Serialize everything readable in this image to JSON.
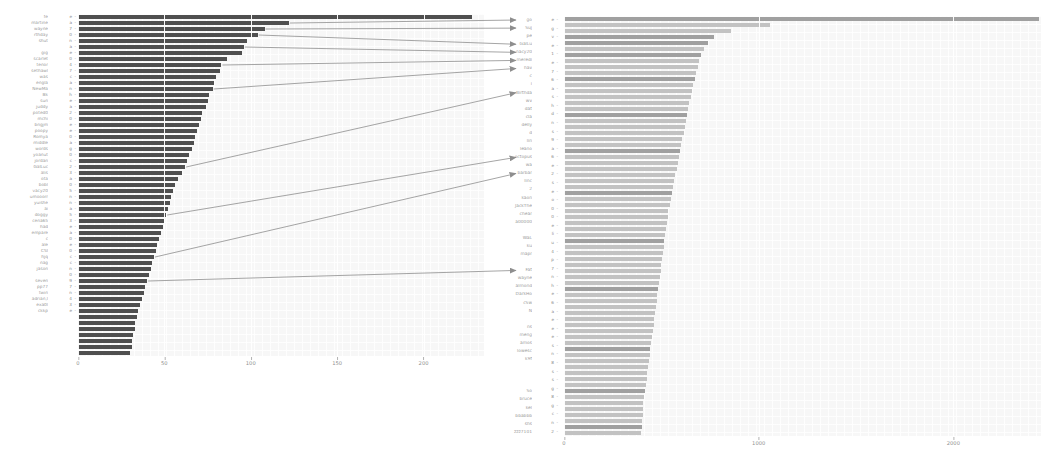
{
  "figure": {
    "background": "#ffffff",
    "panel_background": "#f7f7f7",
    "left_bar_color": "#4f4f4f",
    "right_bar_color": "#c2c2c2",
    "right_bar_highlight_color": "#a0a0a0",
    "arrow_color": "#8e8e8e",
    "tick_text_color": "#8f8f8f",
    "label_text_color": "#9b9b9b"
  },
  "chart_data": [
    {
      "id": "left",
      "type": "bar",
      "orientation": "horizontal",
      "title": "",
      "xlabel": "",
      "ylabel": "",
      "xlim": [
        0,
        235
      ],
      "xticks": [
        0,
        50,
        100,
        150,
        200
      ],
      "grid": true,
      "sorted": "descending",
      "bar_color": "#4f4f4f",
      "categories": [
        "fe",
        "martine",
        "wayne",
        "rthday",
        "shut",
        "",
        "gig",
        "scarlet",
        "tenor",
        "sethawl",
        "was",
        "engla",
        "NewMa",
        "Bk",
        "sun",
        "juddy",
        "poted0",
        "mchi",
        "bngjm",
        "poopy",
        "Romya",
        "middle",
        "words",
        "yoanut",
        "jordan",
        "GalLuc",
        "alis",
        "ota",
        "bobl",
        "vacy20",
        "umooorr",
        "yuishe",
        "ai",
        "doggy",
        "cena65",
        "had",
        "empare",
        "c",
        "ale",
        "CSI",
        "hjq",
        "nag",
        "jason",
        "",
        "seven",
        "pp77",
        "twin",
        "adrian,l",
        "exa0l",
        "ckkp"
      ],
      "values": [
        228,
        122,
        108,
        104,
        98,
        96,
        95,
        86,
        83,
        82,
        80,
        79,
        78,
        76,
        75,
        74,
        72,
        71,
        70,
        69,
        68,
        67,
        66,
        64,
        63,
        62,
        60,
        58,
        56,
        55,
        54,
        53,
        52,
        51,
        50,
        49,
        48,
        47,
        46,
        45,
        44,
        43,
        42,
        41,
        40,
        39,
        38,
        37,
        36,
        35,
        34,
        33,
        33,
        32,
        31,
        31,
        30
      ],
      "ytick_labels": [
        "e",
        "a",
        "7",
        "0",
        "n",
        "a",
        "e",
        "0",
        "4",
        "7",
        "c",
        "a",
        "n",
        "h",
        "e",
        "a",
        "2",
        "0",
        "e",
        "e",
        "0",
        "a",
        "g",
        "0",
        "c",
        "2",
        "3",
        "a",
        "0",
        "5",
        "n",
        "n",
        "a",
        "5",
        "3",
        "e",
        "a",
        "0",
        "e",
        "0",
        "c",
        "c",
        "n",
        "0",
        "9",
        "7",
        "n",
        "4",
        "3",
        "e"
      ]
    },
    {
      "id": "right",
      "type": "bar",
      "orientation": "horizontal",
      "title": "",
      "xlabel": "",
      "ylabel": "",
      "xlim": [
        0,
        2450
      ],
      "xticks": [
        0,
        1000,
        2000
      ],
      "grid": true,
      "sorted": "descending",
      "bar_color": "#c2c2c2",
      "highlight_color": "#a0a0a0",
      "categories": [
        "e",
        "g",
        "v",
        "e",
        "1",
        "e",
        "7",
        "6",
        "a",
        "s",
        "h",
        "d",
        "n",
        "s",
        "9",
        "a",
        "6",
        "e",
        "2",
        "s",
        "e",
        "o",
        "0",
        "0",
        "e",
        "li",
        "u",
        "4",
        "p",
        "7",
        "n",
        "h",
        "e",
        "6",
        "a",
        "e",
        "e",
        "e",
        "s",
        "n",
        "8",
        "s",
        "s",
        "g",
        "8",
        "g",
        "c",
        "n",
        "2"
      ],
      "values": [
        2440,
        1060,
        860,
        770,
        740,
        720,
        705,
        695,
        690,
        680,
        672,
        664,
        656,
        650,
        644,
        638,
        632,
        626,
        620,
        614,
        608,
        602,
        596,
        590,
        584,
        578,
        572,
        566,
        560,
        554,
        548,
        542,
        536,
        532,
        528,
        524,
        520,
        516,
        512,
        508,
        504,
        500,
        496,
        492,
        488,
        484,
        480,
        476,
        472,
        468,
        464,
        460,
        456,
        452,
        448,
        444,
        440,
        436,
        432,
        428,
        424,
        420,
        416,
        412,
        408,
        406,
        404,
        402,
        400,
        398
      ],
      "highlight_rows": [
        0,
        3,
        4,
        6,
        10,
        16,
        22,
        29,
        37,
        45,
        55,
        62,
        68
      ]
    }
  ],
  "middle_labels": [
    "go",
    "Suj",
    "pe",
    "GalLu",
    "nacy20",
    "meredi",
    "hav",
    "c",
    "i",
    "Birthda",
    "wv",
    "dat",
    "cla",
    "delly",
    "d",
    "lin",
    "leano",
    "octopus",
    "wa",
    "barbar",
    "linc",
    "2",
    "kaon",
    "JackThe",
    "chear",
    "a00000",
    "",
    "WaL",
    "ku",
    "mapr",
    "",
    "Fat",
    "wayne",
    "almond",
    "DarkHo",
    "cSw",
    "N",
    "",
    "ns",
    "meng",
    "amos",
    "lowesc",
    "k9f",
    "",
    "",
    "",
    "So",
    "bruce",
    "kel",
    "bbabbb",
    "shs",
    "zzz7101"
  ],
  "right_ytick_labels": [
    "e",
    "g",
    "v",
    "e",
    "1",
    "e",
    "7",
    "6",
    "a",
    "s",
    "h",
    "d",
    "n",
    "s",
    "9",
    "a",
    "6",
    "e",
    "2",
    "s",
    "e",
    "o",
    "0",
    "0",
    "e",
    "li",
    "u",
    "4",
    "p",
    "7",
    "n",
    "h",
    "e",
    "6",
    "a",
    "e",
    "e",
    "e",
    "s",
    "n",
    "8",
    "s",
    "s",
    "g",
    "8",
    "g",
    "c",
    "n",
    "2"
  ],
  "left_xtick_labels": [
    "0",
    "50",
    "100",
    "150",
    "200"
  ],
  "right_xtick_labels": [
    "0",
    "1000",
    "2000"
  ],
  "connectors": [
    {
      "from_row": 1,
      "to_label_index": 0
    },
    {
      "from_row": 2,
      "to_label_index": 1
    },
    {
      "from_row": 3,
      "to_label_index": 3
    },
    {
      "from_row": 5,
      "to_label_index": 4
    },
    {
      "from_row": 8,
      "to_label_index": 5
    },
    {
      "from_row": 12,
      "to_label_index": 6
    },
    {
      "from_row": 25,
      "to_label_index": 9
    },
    {
      "from_row": 33,
      "to_label_index": 17
    },
    {
      "from_row": 40,
      "to_label_index": 19
    },
    {
      "from_row": 44,
      "to_label_index": 31
    }
  ]
}
